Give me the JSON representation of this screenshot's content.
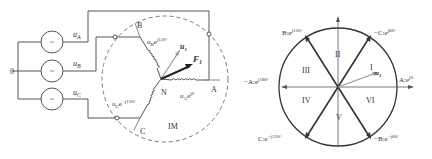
{
  "circuit": {
    "neutral_label": "0",
    "sources": [
      {
        "label": "u",
        "sub": "A",
        "symbol": "~"
      },
      {
        "label": "u",
        "sub": "B",
        "symbol": "~"
      },
      {
        "label": "u",
        "sub": "C",
        "symbol": "~"
      }
    ],
    "terminals": {
      "A": "A",
      "B": "B",
      "C": "C"
    },
    "star_point": "N",
    "motor_label": "IM",
    "winding_labels": {
      "B": {
        "base": "u",
        "sub": "B",
        "exp": "e",
        "sup": "j120°"
      },
      "C": {
        "base": "u",
        "sub": "C",
        "exp": "e",
        "sup": "−j120°"
      },
      "A": {
        "base": "u",
        "sub": "A",
        "exp": "e",
        "sup": "j0"
      }
    },
    "vectors": {
      "u1": {
        "base": "u",
        "sub": "1"
      },
      "F1": {
        "base": "F",
        "sub": "1"
      }
    }
  },
  "vector_diagram": {
    "sectors": [
      "I",
      "II",
      "III",
      "IV",
      "V",
      "VI"
    ],
    "axis_labels": [
      {
        "id": "A",
        "text": "A:e",
        "sup": "j0"
      },
      {
        "id": "negC",
        "text": "−C:e",
        "sup": "j60°"
      },
      {
        "id": "B",
        "text": "B:e",
        "sup": "j120°"
      },
      {
        "id": "negA",
        "text": "−A:e",
        "sup": "j180°"
      },
      {
        "id": "C",
        "text": "C:e",
        "sup": "−j120°"
      },
      {
        "id": "negB",
        "text": "−B:e",
        "sup": "−j60°"
      }
    ],
    "vector": {
      "base": "u",
      "sub": "1"
    }
  }
}
